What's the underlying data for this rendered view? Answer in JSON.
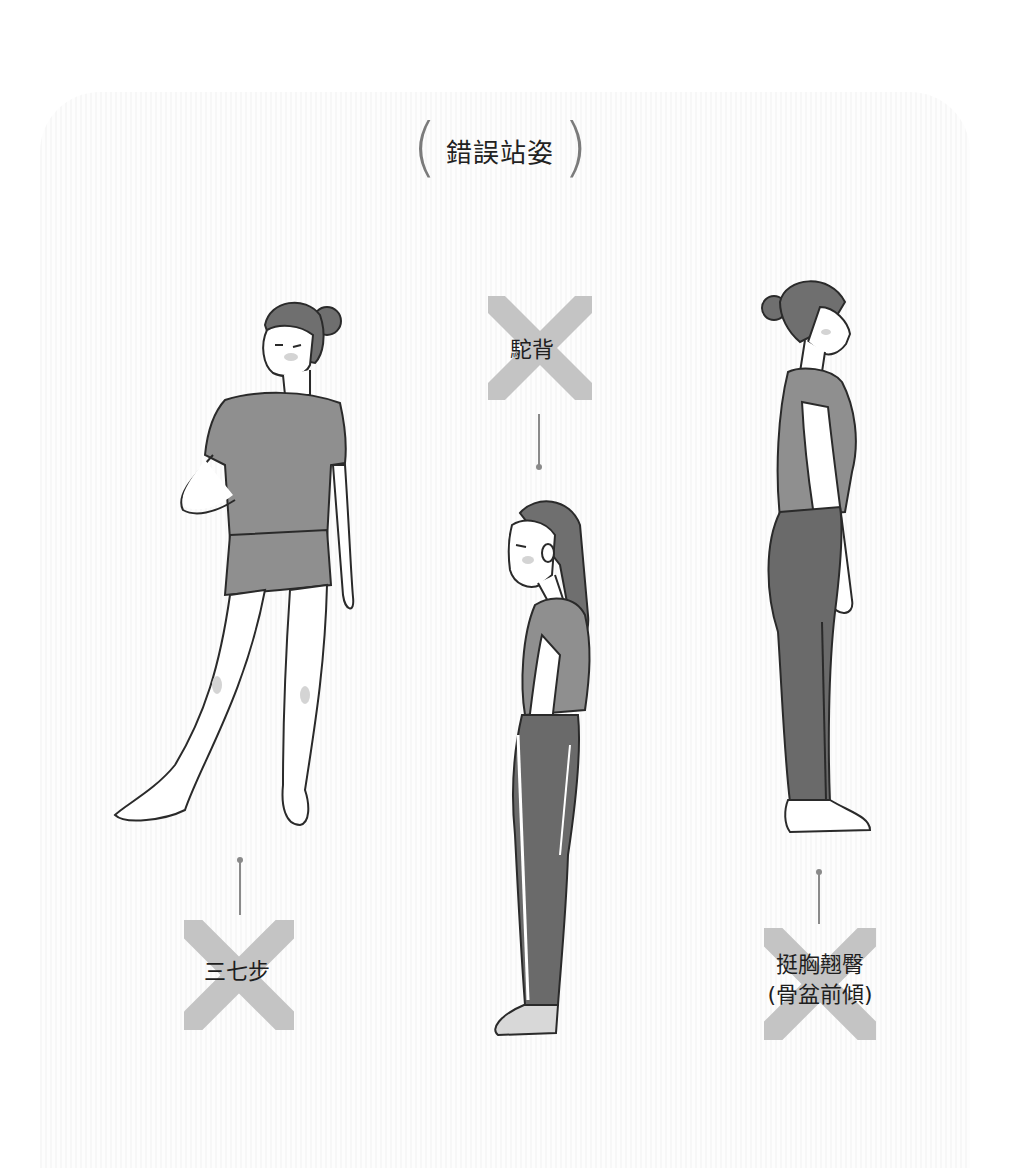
{
  "title": {
    "text": "錯誤站姿",
    "paren_left": "(",
    "paren_right": ")"
  },
  "colors": {
    "background": "#ffffff",
    "panel_stripe": "#f7f7f7",
    "x_mark": "#c4c4c4",
    "connector": "#8a8a8a",
    "clothing": "#8f8f8f",
    "pants": "#6a6a6a",
    "hair": "#6f6f6f",
    "outline": "#2a2a2a",
    "text": "#1e1e1e"
  },
  "postures": [
    {
      "id": "hunchback",
      "label": "駝背",
      "icon": "x-mark-icon",
      "figure": "woman-side-view-slouching"
    },
    {
      "id": "uneven-stance",
      "label": "三七步",
      "icon": "x-mark-icon",
      "figure": "woman-hand-on-hip-weight-on-one-leg"
    },
    {
      "id": "anterior-pelvic-tilt",
      "label_line1": "挺胸翹臀",
      "label_line2": "(骨盆前傾)",
      "icon": "x-mark-icon",
      "figure": "woman-side-view-chest-out"
    }
  ]
}
